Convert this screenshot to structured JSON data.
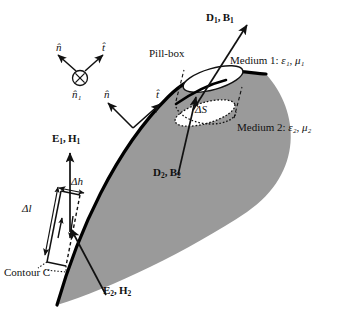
{
  "figure": {
    "canvas": {
      "width": 341,
      "height": 315,
      "background": "#ffffff"
    },
    "colors": {
      "medium2_fill": "#9a9a9a",
      "interface_stroke": "#000000",
      "line_stroke": "#111111",
      "text": "#111111"
    }
  },
  "labels": {
    "pill_box": "Pill-box",
    "medium1": "Medium 1:",
    "medium1_params": "ε₁, μ₁",
    "medium2": "Medium 2:",
    "medium2_params": "ε₂, μ₂",
    "contour_c": "Contour C",
    "delta_s": "ΔS",
    "delta_h": "Δh",
    "delta_l": "Δl",
    "n_hat_triad": "n̂",
    "t_hat_triad": "t̂",
    "n1_hat_triad": "n̂₁",
    "n_hat_surface": "n̂",
    "t_hat_surface": "t̂",
    "eps1": "ε",
    "mu1": "μ"
  },
  "fields": {
    "d1_b1": {
      "d": "D",
      "d_sub": "1",
      "b": "B",
      "b_sub": "1",
      "text": "D₁, B₁"
    },
    "d2_b2": {
      "d": "D",
      "d_sub": "2",
      "b": "B",
      "b_sub": "2",
      "text": "D₂, B₂"
    },
    "e1_h1": {
      "e": "E",
      "e_sub": "1",
      "h": "H",
      "h_sub": "1",
      "text": "E₁, H₁"
    },
    "e2_h2": {
      "e": "E",
      "e_sub": "2",
      "h": "H",
      "h_sub": "2",
      "text": "E₂, H₂"
    }
  },
  "icons": {
    "into_page": "⊗",
    "comma": ","
  },
  "geometry": {
    "interface_path": "M 57,305 C 78,232 115,150 168,97 C 205,60 240,73 266,74",
    "medium2_fill_path": "M 57,305 C 78,232 115,150 168,97 C 205,60 240,73 266,74 C 300,110 305,170 250,210 C 190,252 110,290 57,305 Z",
    "medium2_outer_edge": "M 266,74 C 300,110 305,172 248,211 C 192,249 112,288 57,305"
  }
}
